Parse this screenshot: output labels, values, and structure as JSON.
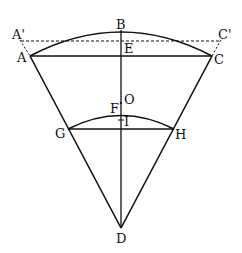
{
  "diagram": {
    "labels": {
      "B": "B",
      "A_prime": "A'",
      "C_prime": "C'",
      "E": "E",
      "A": "A",
      "C": "C",
      "O": "O",
      "F": "F",
      "I": "I",
      "G": "G",
      "H": "H",
      "D": "D"
    },
    "colors": {
      "stroke": "#111111",
      "background": "#ffffff"
    }
  }
}
